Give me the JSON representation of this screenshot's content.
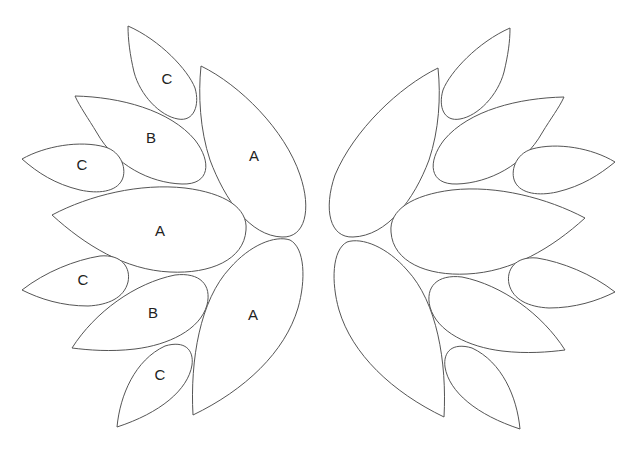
{
  "diagram": {
    "stroke_color": "#555555",
    "fill_color": "#ffffff",
    "background": "#ffffff",
    "left_cluster": {
      "leaves": [
        {
          "id": "left-top-c",
          "label": "C"
        },
        {
          "id": "left-top-a",
          "label": "A"
        },
        {
          "id": "left-top-b",
          "label": "B"
        },
        {
          "id": "left-mid-c",
          "label": "C"
        },
        {
          "id": "left-mid-a",
          "label": "A"
        },
        {
          "id": "left-lower-c",
          "label": "C"
        },
        {
          "id": "left-lower-b",
          "label": "B"
        },
        {
          "id": "left-lower-a",
          "label": "A"
        },
        {
          "id": "left-bottom-c",
          "label": "C"
        }
      ]
    },
    "right_cluster": {
      "leaves": [
        {
          "id": "right-top-c",
          "label": ""
        },
        {
          "id": "right-top-a",
          "label": ""
        },
        {
          "id": "right-top-b",
          "label": ""
        },
        {
          "id": "right-mid-c",
          "label": ""
        },
        {
          "id": "right-mid-a",
          "label": ""
        },
        {
          "id": "right-lower-c",
          "label": ""
        },
        {
          "id": "right-lower-b",
          "label": ""
        },
        {
          "id": "right-lower-a",
          "label": ""
        },
        {
          "id": "right-bottom-c",
          "label": ""
        }
      ]
    }
  }
}
